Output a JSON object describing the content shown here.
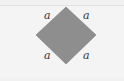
{
  "figure": {
    "shape": "square rotated 45 degrees (rhombus/diamond)",
    "fill_color": "#8e8e8e",
    "stroke_color": "#7a7a7a",
    "side_labels": [
      "a",
      "a",
      "a",
      "a"
    ]
  }
}
